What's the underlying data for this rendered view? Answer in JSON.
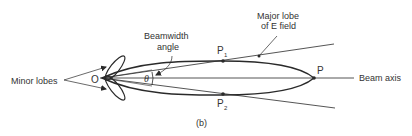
{
  "diagram": {
    "type": "antenna-radiation-pattern",
    "caption": "(b)",
    "labels": {
      "minor_lobes": "Minor lobes",
      "origin": "O",
      "beamwidth_line1": "Beamwidth",
      "beamwidth_line2": "angle",
      "theta": "θ",
      "p1": "P",
      "p1_sub": "1",
      "p2": "P",
      "p2_sub": "2",
      "p": "P",
      "major_lobe_line1": "Major lobe",
      "major_lobe_line2": "of E field",
      "beam_axis": "Beam axis"
    },
    "colors": {
      "line": "#2a2a2a",
      "text": "#333333",
      "background": "#ffffff"
    }
  }
}
